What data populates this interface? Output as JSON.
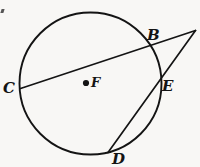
{
  "figure": {
    "kind": "circle-geometry-diagram",
    "background_color": "#f8f7f5",
    "stroke_color": "#141414",
    "canvas": {
      "width": 200,
      "height": 167
    },
    "circle": {
      "name": "circle-F",
      "center_x": 90.5,
      "center_y": 83.5,
      "radius": 71,
      "stroke_width": 1.9
    },
    "center_dot": {
      "x": 86,
      "y": 83,
      "r": 3.1
    },
    "secant_upper": {
      "name": "secant-C-B-P",
      "x1": 20.5,
      "y1": 88.5,
      "x2": 195.5,
      "y2": 30.5,
      "stroke_width": 1.7
    },
    "secant_lower": {
      "name": "secant-D-E-P",
      "x1": 108,
      "y1": 152.5,
      "x2": 195.5,
      "y2": 30.5,
      "stroke_width": 1.7
    },
    "points": [
      {
        "id": "B",
        "x": 150,
        "y": 46
      },
      {
        "id": "C",
        "x": 20.5,
        "y": 88.5
      },
      {
        "id": "E",
        "x": 158,
        "y": 84
      },
      {
        "id": "D",
        "x": 108,
        "y": 152.5
      },
      {
        "id": "F",
        "x": 86,
        "y": 83
      },
      {
        "id": "P",
        "x": 195.5,
        "y": 30.5
      }
    ],
    "labels": {
      "b": {
        "text": "B",
        "left": 147,
        "top": 28
      },
      "c": {
        "text": "C",
        "left": 3,
        "top": 81
      },
      "e": {
        "text": "E",
        "left": 162,
        "top": 79
      },
      "d": {
        "text": "D",
        "left": 112,
        "top": 152
      },
      "f": {
        "text": "F",
        "left": 91,
        "top": 76
      }
    },
    "artifact": {
      "name": "scan-artifact-mark"
    }
  }
}
